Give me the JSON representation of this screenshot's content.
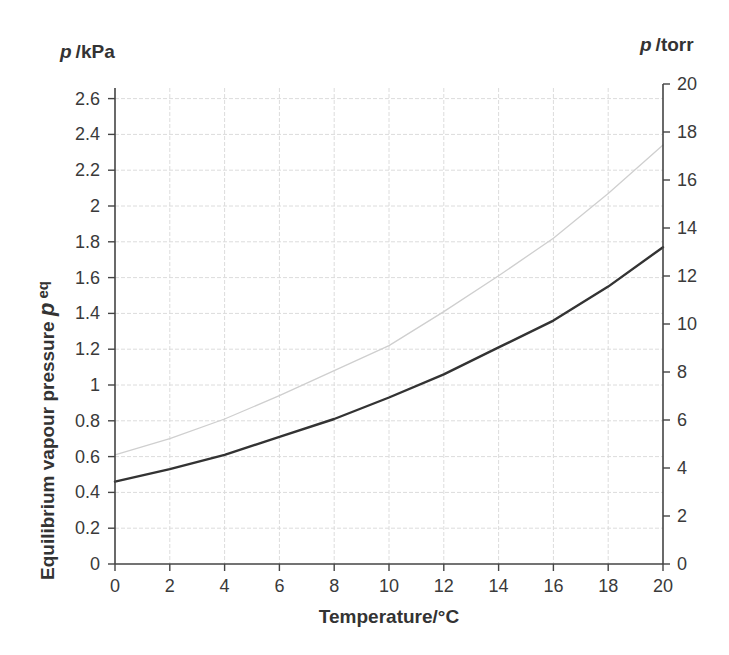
{
  "chart_data": {
    "type": "line",
    "title": "",
    "xlabel": "Temperature/°C",
    "ylabel": "Equilibrium vapour pressure p eq",
    "ylabel_main": "Equilibrium vapour pressure ",
    "ylabel_symbol": "p",
    "ylabel_subscript": "eq",
    "left_unit": {
      "symbol": "p",
      "unit": "/kPa"
    },
    "right_unit": {
      "symbol": "p",
      "unit": "/torr"
    },
    "xlim": [
      0,
      20
    ],
    "ylim": [
      0,
      2.6
    ],
    "y2lim": [
      0,
      20
    ],
    "grid": true,
    "legend": null,
    "x_ticks": [
      "0",
      "2",
      "4",
      "6",
      "8",
      "10",
      "12",
      "14",
      "16",
      "18",
      "20"
    ],
    "y_ticks": [
      "0",
      "0.2",
      "0.4",
      "0.6",
      "0.8",
      "1",
      "1.2",
      "1.4",
      "1.6",
      "1.8",
      "2",
      "2.2",
      "2.4",
      "2.6"
    ],
    "y2_ticks": [
      "0",
      "2",
      "4",
      "6",
      "8",
      "10",
      "12",
      "14",
      "16",
      "18",
      "20"
    ],
    "x": [
      0,
      2,
      4,
      6,
      8,
      10,
      12,
      14,
      16,
      18,
      20
    ],
    "series": [
      {
        "name": "dark curve",
        "color": "#333333",
        "width": 2.4,
        "values": [
          0.46,
          0.53,
          0.61,
          0.71,
          0.81,
          0.93,
          1.06,
          1.21,
          1.36,
          1.55,
          1.77
        ]
      },
      {
        "name": "light curve",
        "color": "#cfcfcf",
        "width": 1.3,
        "values": [
          0.61,
          0.7,
          0.81,
          0.94,
          1.08,
          1.22,
          1.41,
          1.61,
          1.82,
          2.07,
          2.34
        ]
      }
    ]
  },
  "colors": {
    "axis": "#444444",
    "grid": "#dcdcdc",
    "text": "#333333"
  }
}
